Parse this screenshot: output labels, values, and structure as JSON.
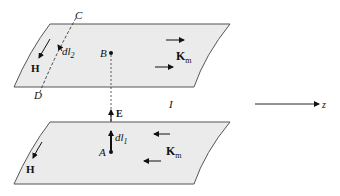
{
  "diagram": {
    "plate_fill": "#ebebeb",
    "plate_stroke": "#555555",
    "ink": "#111111",
    "top_plate": {
      "labels": {
        "C": "C",
        "D": "D",
        "B": "B",
        "dl2": "dl",
        "dl2_sub": "2",
        "H": "H",
        "K": "K",
        "K_sub": "m"
      }
    },
    "bottom_plate": {
      "labels": {
        "A": "A",
        "dl1": "dl",
        "dl1_sub": "1",
        "H": "H",
        "K": "K",
        "K_sub": "m",
        "E": "E"
      }
    },
    "gap_label": "I",
    "axis_label": "z"
  }
}
